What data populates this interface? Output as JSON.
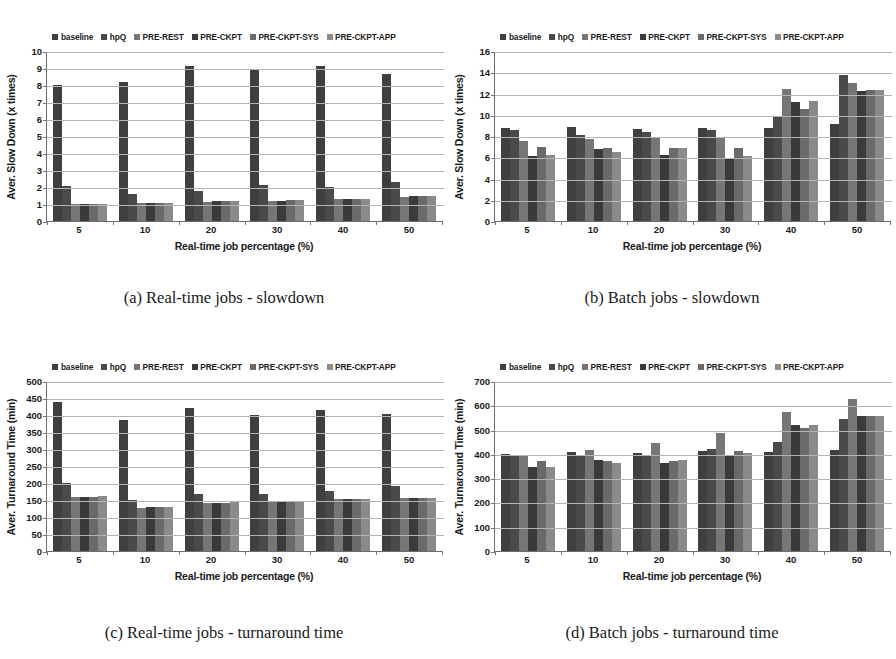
{
  "legend": {
    "items": [
      {
        "label": "baseline",
        "color": "#3f3f3f"
      },
      {
        "label": "hpQ",
        "color": "#4a4a4a"
      },
      {
        "label": "PRE-REST",
        "color": "#767676"
      },
      {
        "label": "PRE-CKPT",
        "color": "#3a3a3a"
      },
      {
        "label": "PRE-CKPT-SYS",
        "color": "#6a6a6a"
      },
      {
        "label": "PRE-CKPT-APP",
        "color": "#8a8a8a"
      }
    ]
  },
  "series_names": [
    "baseline",
    "hpQ",
    "PRE-REST",
    "PRE-CKPT",
    "PRE-CKPT-SYS",
    "PRE-CKPT-APP"
  ],
  "series_colors": [
    "#3f3f3f",
    "#4a4a4a",
    "#767676",
    "#3a3a3a",
    "#6a6a6a",
    "#8a8a8a"
  ],
  "panels": [
    {
      "id": "a",
      "caption": "(a) Real-time jobs - slowdown",
      "ylabel": "Aver. Slow Down (x times)",
      "xlabel": "Real-time job percentage (%)",
      "yticks": [
        0,
        1,
        2,
        3,
        4,
        5,
        6,
        7,
        8,
        9,
        10
      ]
    },
    {
      "id": "b",
      "caption": "(b) Batch jobs - slowdown",
      "ylabel": "Aver. Slow Down (x times)",
      "xlabel": "Real-time job percentage (%)",
      "yticks": [
        0,
        2,
        4,
        6,
        8,
        10,
        12,
        14,
        16
      ]
    },
    {
      "id": "c",
      "caption": "(c) Real-time jobs - turnaround time",
      "ylabel": "Aver. Turnaround Time (min)",
      "xlabel": "Real-time job percentage (%)",
      "yticks": [
        0,
        50,
        100,
        150,
        200,
        250,
        300,
        350,
        400,
        450,
        500
      ]
    },
    {
      "id": "d",
      "caption": "(d) Batch jobs - turnaround time",
      "ylabel": "Aver. Turnaround Time (min)",
      "xlabel": "Real-time job percentage (%)",
      "yticks": [
        0,
        100,
        200,
        300,
        400,
        500,
        600,
        700
      ]
    }
  ],
  "chart_data": [
    {
      "panel": "a",
      "type": "bar",
      "title": "(a) Real-time jobs - slowdown",
      "xlabel": "Real-time job percentage (%)",
      "ylabel": "Aver. Slow Down (x times)",
      "categories": [
        "5",
        "10",
        "20",
        "30",
        "40",
        "50"
      ],
      "ylim": [
        0,
        10
      ],
      "yticks": [
        0,
        1,
        2,
        3,
        4,
        5,
        6,
        7,
        8,
        9,
        10
      ],
      "grid": true,
      "legend_position": "top",
      "series": [
        {
          "name": "baseline",
          "values": [
            8.0,
            8.2,
            9.1,
            8.9,
            9.1,
            8.65
          ]
        },
        {
          "name": "hpQ",
          "values": [
            2.05,
            1.6,
            1.75,
            2.1,
            2.0,
            2.3
          ]
        },
        {
          "name": "PRE-REST",
          "values": [
            1.0,
            1.05,
            1.1,
            1.2,
            1.3,
            1.4
          ]
        },
        {
          "name": "PRE-CKPT",
          "values": [
            1.0,
            1.05,
            1.15,
            1.2,
            1.3,
            1.45
          ]
        },
        {
          "name": "PRE-CKPT-SYS",
          "values": [
            1.0,
            1.05,
            1.15,
            1.25,
            1.3,
            1.45
          ]
        },
        {
          "name": "PRE-CKPT-APP",
          "values": [
            1.0,
            1.08,
            1.15,
            1.25,
            1.3,
            1.45
          ]
        }
      ]
    },
    {
      "panel": "b",
      "type": "bar",
      "title": "(b) Batch jobs - slowdown",
      "xlabel": "Real-time job percentage (%)",
      "ylabel": "Aver. Slow Down (x times)",
      "categories": [
        "5",
        "10",
        "20",
        "30",
        "40",
        "50"
      ],
      "ylim": [
        0,
        16
      ],
      "yticks": [
        0,
        2,
        4,
        6,
        8,
        10,
        12,
        14,
        16
      ],
      "grid": true,
      "legend_position": "top",
      "series": [
        {
          "name": "baseline",
          "values": [
            8.8,
            8.85,
            8.7,
            8.8,
            8.75,
            9.1
          ]
        },
        {
          "name": "hpQ",
          "values": [
            8.6,
            8.1,
            8.4,
            8.55,
            9.9,
            13.7
          ]
        },
        {
          "name": "PRE-REST",
          "values": [
            7.5,
            7.7,
            7.8,
            7.9,
            12.4,
            13.0
          ]
        },
        {
          "name": "PRE-CKPT",
          "values": [
            6.1,
            6.8,
            6.2,
            5.95,
            11.2,
            12.2
          ]
        },
        {
          "name": "PRE-CKPT-SYS",
          "values": [
            7.0,
            6.85,
            6.9,
            6.9,
            10.5,
            12.3
          ]
        },
        {
          "name": "PRE-CKPT-APP",
          "values": [
            6.2,
            6.5,
            6.9,
            6.15,
            11.3,
            12.3
          ]
        }
      ]
    },
    {
      "panel": "c",
      "type": "bar",
      "title": "(c) Real-time jobs - turnaround time",
      "xlabel": "Real-time job percentage (%)",
      "ylabel": "Aver. Turnaround Time (min)",
      "categories": [
        "5",
        "10",
        "20",
        "30",
        "40",
        "50"
      ],
      "ylim": [
        0,
        500
      ],
      "yticks": [
        0,
        50,
        100,
        150,
        200,
        250,
        300,
        350,
        400,
        450,
        500
      ],
      "grid": true,
      "legend_position": "top",
      "series": [
        {
          "name": "baseline",
          "values": [
            438,
            385,
            422,
            399,
            415,
            404
          ]
        },
        {
          "name": "hpQ",
          "values": [
            199,
            151,
            168,
            167,
            176,
            190
          ]
        },
        {
          "name": "PRE-REST",
          "values": [
            159,
            127,
            140,
            144,
            153,
            156
          ]
        },
        {
          "name": "PRE-CKPT",
          "values": [
            159,
            128,
            140,
            145,
            153,
            156
          ]
        },
        {
          "name": "PRE-CKPT-SYS",
          "values": [
            160,
            128,
            142,
            145,
            153,
            156
          ]
        },
        {
          "name": "PRE-CKPT-APP",
          "values": [
            161,
            129,
            143,
            145,
            153,
            156
          ]
        }
      ]
    },
    {
      "panel": "d",
      "type": "bar",
      "title": "(d) Batch jobs - turnaround time",
      "xlabel": "Real-time job percentage (%)",
      "ylabel": "Aver. Turnaround Time (min)",
      "categories": [
        "5",
        "10",
        "20",
        "30",
        "40",
        "50"
      ],
      "ylim": [
        0,
        700
      ],
      "yticks": [
        0,
        100,
        200,
        300,
        400,
        500,
        600,
        700
      ],
      "grid": true,
      "legend_position": "top",
      "series": [
        {
          "name": "baseline",
          "values": [
            400,
            408,
            403,
            411,
            406,
            415
          ]
        },
        {
          "name": "hpQ",
          "values": [
            394,
            390,
            393,
            419,
            450,
            543
          ]
        },
        {
          "name": "PRE-REST",
          "values": [
            391,
            414,
            444,
            485,
            573,
            625
          ]
        },
        {
          "name": "PRE-CKPT",
          "values": [
            347,
            373,
            361,
            390,
            518,
            558
          ]
        },
        {
          "name": "PRE-CKPT-SYS",
          "values": [
            370,
            370,
            372,
            411,
            508,
            556
          ]
        },
        {
          "name": "PRE-CKPT-APP",
          "values": [
            348,
            363,
            376,
            404,
            518,
            558
          ]
        }
      ]
    }
  ]
}
